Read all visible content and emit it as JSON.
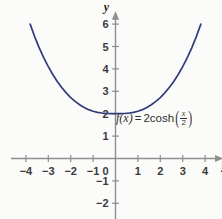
{
  "chart_data": {
    "type": "line",
    "title": "",
    "subtitle": "",
    "xlabel": "x",
    "ylabel": "y",
    "xlim": [
      -4.4,
      4.4
    ],
    "ylim": [
      -2.6,
      6.4
    ],
    "grid": false,
    "legend": null,
    "annotation": "f(x) = 2cosh(x/2)",
    "annotation_parts": {
      "fname": "f(x)",
      "equals": "=",
      "coefficient_and_fn": "2cosh",
      "paren_open": "(",
      "numerator": "x",
      "denominator": "2",
      "paren_close": ")"
    },
    "series": [
      {
        "name": "f(x) = 2cosh(x/2)",
        "color": "#333c7a",
        "x": [
          -3.81,
          -3.6,
          -3.4,
          -3.2,
          -3.0,
          -2.8,
          -2.6,
          -2.4,
          -2.2,
          -2.0,
          -1.8,
          -1.6,
          -1.4,
          -1.2,
          -1.0,
          -0.8,
          -0.6,
          -0.4,
          -0.2,
          0.0,
          0.2,
          0.4,
          0.6,
          0.8,
          1.0,
          1.2,
          1.4,
          1.6,
          1.8,
          2.0,
          2.2,
          2.4,
          2.6,
          2.8,
          3.0,
          3.2,
          3.4,
          3.6,
          3.81
        ],
        "y": [
          6.0,
          5.42,
          4.93,
          4.49,
          4.1,
          3.75,
          3.44,
          3.17,
          2.93,
          2.72,
          2.55,
          2.4,
          2.28,
          2.18,
          2.11,
          2.06,
          2.03,
          2.01,
          2.0,
          2.0,
          2.0,
          2.01,
          2.03,
          2.06,
          2.11,
          2.18,
          2.28,
          2.4,
          2.55,
          2.72,
          2.93,
          3.17,
          3.44,
          3.75,
          4.1,
          4.49,
          4.93,
          5.42,
          6.0
        ]
      }
    ],
    "x_ticks": [
      -4,
      -3,
      -2,
      -1,
      0,
      1,
      2,
      3,
      4
    ],
    "x_tick_labels": [
      "−4",
      "−3",
      "−2",
      "−1",
      "0",
      "1",
      "2",
      "3",
      "4"
    ],
    "y_ticks": [
      -2,
      -1,
      1,
      2,
      3,
      4,
      5,
      6
    ],
    "y_tick_labels": [
      "−2",
      "−1",
      "1",
      "2",
      "3",
      "4",
      "5",
      "6"
    ],
    "axis_color": "#8e8e8e",
    "background": "#fbfbf9",
    "tick_label_color": "#3a3a3a"
  },
  "labels": {
    "x_axis_name": "x",
    "y_axis_name": "y"
  }
}
